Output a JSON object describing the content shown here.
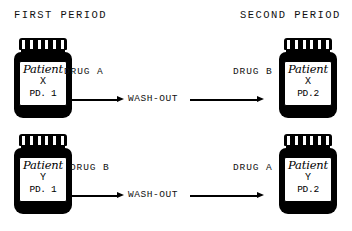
{
  "headings": {
    "first": "FIRST PERIOD",
    "second": "SECOND PERIOD"
  },
  "washout_label": "WASH-OUT",
  "rows": [
    {
      "left_bottle": {
        "name": "Patient",
        "code": "X",
        "id": "PD. 1"
      },
      "left_drug": "DRUG A",
      "right_drug": "DRUG B",
      "right_bottle": {
        "name": "Patient",
        "code": "X",
        "id": "PD.2"
      }
    },
    {
      "left_bottle": {
        "name": "Patient",
        "code": "Y",
        "id": "PD. 1"
      },
      "left_drug": "DRUG B",
      "right_drug": "DRUG A",
      "right_bottle": {
        "name": "Patient",
        "code": "Y",
        "id": "PD.2"
      }
    }
  ],
  "colors": {
    "ink": "#000000",
    "background": "#ffffff"
  }
}
